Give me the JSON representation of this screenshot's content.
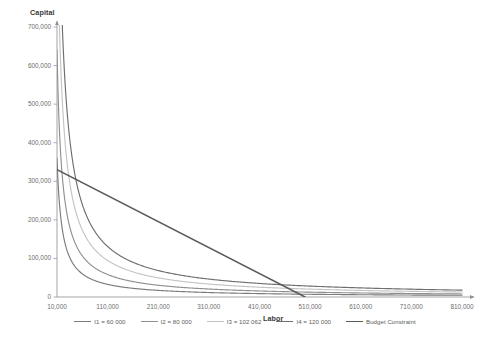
{
  "chart_data": {
    "type": "line",
    "title": "",
    "xlabel": "Labor",
    "ylabel": "Capital",
    "xlim": [
      10000,
      810000
    ],
    "ylim": [
      0,
      700000
    ],
    "grid": false,
    "legend_position": "bottom",
    "xticks": [
      "10,000",
      "110,000",
      "210,000",
      "310,000",
      "410,000",
      "510,000",
      "610,000",
      "710,000",
      "810,000"
    ],
    "xtick_values": [
      10000,
      110000,
      210000,
      310000,
      410000,
      510000,
      610000,
      710000,
      810000
    ],
    "yticks": [
      "0",
      "100,000",
      "200,000",
      "300,000",
      "400,000",
      "500,000",
      "600,000",
      "700,000"
    ],
    "ytick_values": [
      0,
      100000,
      200000,
      300000,
      400000,
      500000,
      600000,
      700000
    ],
    "series": [
      {
        "name": "I1 = 60 000",
        "color": "#7b7b7b",
        "kind": "isoquant",
        "output": 60000,
        "constant": 3600000000,
        "points": [
          {
            "x": 10000,
            "y": 360000
          },
          {
            "x": 20000,
            "y": 180000
          },
          {
            "x": 30000,
            "y": 120000
          },
          {
            "x": 45000,
            "y": 80000
          },
          {
            "x": 60000,
            "y": 60000
          },
          {
            "x": 90000,
            "y": 40000
          },
          {
            "x": 120000,
            "y": 30000
          },
          {
            "x": 180000,
            "y": 20000
          },
          {
            "x": 240000,
            "y": 15000
          },
          {
            "x": 360000,
            "y": 10000
          },
          {
            "x": 480000,
            "y": 7500
          },
          {
            "x": 600000,
            "y": 6000
          },
          {
            "x": 720000,
            "y": 5000
          },
          {
            "x": 810000,
            "y": 4444
          }
        ]
      },
      {
        "name": "I2 = 80 000",
        "color": "#8f8f8f",
        "kind": "isoquant",
        "output": 80000,
        "constant": 6400000000,
        "points": [
          {
            "x": 10000,
            "y": 640000
          },
          {
            "x": 20000,
            "y": 320000
          },
          {
            "x": 32000,
            "y": 200000
          },
          {
            "x": 53333,
            "y": 120000
          },
          {
            "x": 80000,
            "y": 80000
          },
          {
            "x": 128000,
            "y": 50000
          },
          {
            "x": 160000,
            "y": 40000
          },
          {
            "x": 213333,
            "y": 30000
          },
          {
            "x": 320000,
            "y": 20000
          },
          {
            "x": 426667,
            "y": 15000
          },
          {
            "x": 533333,
            "y": 12000
          },
          {
            "x": 640000,
            "y": 10000
          },
          {
            "x": 810000,
            "y": 7901
          }
        ]
      },
      {
        "name": "I3 = 102 062",
        "color": "#c4c4c4",
        "kind": "isoquant",
        "output": 102062,
        "constant": 10416651844,
        "points": [
          {
            "x": 15000,
            "y": 694443
          },
          {
            "x": 20000,
            "y": 520833
          },
          {
            "x": 35000,
            "y": 297619
          },
          {
            "x": 52000,
            "y": 200320
          },
          {
            "x": 80000,
            "y": 130208
          },
          {
            "x": 102062,
            "y": 102062
          },
          {
            "x": 150000,
            "y": 69444
          },
          {
            "x": 210000,
            "y": 49603
          },
          {
            "x": 310000,
            "y": 33602
          },
          {
            "x": 410000,
            "y": 25406
          },
          {
            "x": 510000,
            "y": 20425
          },
          {
            "x": 610000,
            "y": 17077
          },
          {
            "x": 710000,
            "y": 14671
          },
          {
            "x": 810000,
            "y": 12860
          }
        ]
      },
      {
        "name": "I4 = 120 000",
        "color": "#6e6e6e",
        "kind": "isoquant",
        "output": 120000,
        "constant": 14400000000,
        "points": [
          {
            "x": 21000,
            "y": 685714
          },
          {
            "x": 30000,
            "y": 480000
          },
          {
            "x": 45000,
            "y": 320000
          },
          {
            "x": 72000,
            "y": 200000
          },
          {
            "x": 120000,
            "y": 120000
          },
          {
            "x": 180000,
            "y": 80000
          },
          {
            "x": 240000,
            "y": 60000
          },
          {
            "x": 360000,
            "y": 40000
          },
          {
            "x": 480000,
            "y": 30000
          },
          {
            "x": 600000,
            "y": 24000
          },
          {
            "x": 720000,
            "y": 20000
          },
          {
            "x": 810000,
            "y": 17778
          }
        ]
      },
      {
        "name": "Budget Constraint",
        "color": "#5a5a5a",
        "kind": "line",
        "points": [
          {
            "x": 10000,
            "y": 330000
          },
          {
            "x": 500000,
            "y": 0
          }
        ]
      }
    ]
  },
  "axes": {
    "capital_title": "Capital",
    "labor_title": "Labor"
  },
  "legend": {
    "items": [
      {
        "label": "I1 = 60 000",
        "color": "#7b7b7b"
      },
      {
        "label": "I2 = 80 000",
        "color": "#8f8f8f"
      },
      {
        "label": "I3 = 102 062",
        "color": "#c4c4c4"
      },
      {
        "label": "I4 = 120 000",
        "color": "#6e6e6e"
      },
      {
        "label": "Budget Constraint",
        "color": "#5a5a5a"
      }
    ]
  }
}
